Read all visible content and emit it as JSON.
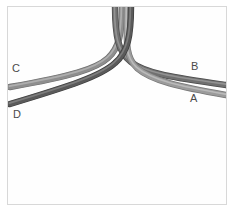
{
  "figure": {
    "width": 235,
    "height": 213,
    "background_color": "#ffffff",
    "panel_background_color": "#fefefe",
    "panel_border_color": "#d8d8d8"
  },
  "labels": [
    {
      "id": "A",
      "text": "A",
      "x": 190,
      "y": 93,
      "color": "#4a4a4a",
      "side": "right",
      "position": "lower"
    },
    {
      "id": "B",
      "text": "B",
      "x": 191,
      "y": 61,
      "color": "#4a4a4a",
      "side": "right",
      "position": "upper"
    },
    {
      "id": "C",
      "text": "C",
      "x": 12,
      "y": 63,
      "color": "#4a4a4a",
      "side": "left",
      "position": "upper"
    },
    {
      "id": "D",
      "text": "D",
      "x": 13,
      "y": 109,
      "color": "#4a4a4a",
      "side": "left",
      "position": "lower"
    }
  ],
  "cables": [
    {
      "id": "C",
      "label": "C",
      "color": "#8e8e8e",
      "highlight_color": "#b8b8b8",
      "shadow_color": "#6e6e6e",
      "width": 5.0,
      "routes_to": "lower-left",
      "path": "M 122 5 C 122 34, 119 48, 108 58 C 96 69, 72 76, 10 87"
    },
    {
      "id": "D",
      "label": "D",
      "color": "#5a5a5a",
      "highlight_color": "#8a8a8a",
      "shadow_color": "#3c3c3c",
      "width": 5.0,
      "routes_to": "lower-left",
      "path": "M 131 5 C 131 36, 128 52, 115 63 C 101 76, 70 86, 10 104"
    },
    {
      "id": "B",
      "label": "B",
      "color": "#707070",
      "highlight_color": "#9d9d9d",
      "shadow_color": "#4a4a4a",
      "width": 5.0,
      "routes_to": "lower-right",
      "path": "M 115 5 C 115 36, 118 52, 131 62 C 146 74, 176 78, 226 85"
    },
    {
      "id": "A",
      "label": "A",
      "color": "#9b9b9b",
      "highlight_color": "#c4c4c4",
      "shadow_color": "#777777",
      "width": 5.0,
      "routes_to": "lower-right",
      "path": "M 127 5 C 127 38, 124 56, 137 68 C 152 81, 180 87, 226 95"
    }
  ],
  "junction": {
    "x": 130,
    "y": 70
  }
}
